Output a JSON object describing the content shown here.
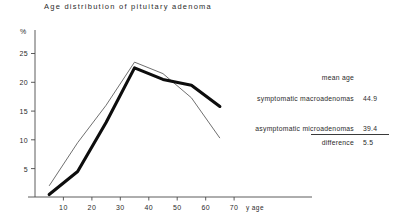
{
  "chart_data": {
    "type": "line",
    "title": "Age distribution of pituitary adenoma",
    "xlabel": "y age",
    "ylabel": "%",
    "x": [
      5,
      15,
      25,
      35,
      45,
      55,
      65
    ],
    "xlim": [
      0,
      75
    ],
    "ylim": [
      0,
      27
    ],
    "xticks": [
      10,
      20,
      30,
      40,
      50,
      60,
      70
    ],
    "yticks": [
      5,
      10,
      15,
      20,
      25
    ],
    "grid": false,
    "legend_position": "right",
    "series": [
      {
        "name": "symptomatic macroadenomas",
        "style": "thick",
        "mean_age": "44.9",
        "values": [
          0.5,
          4.5,
          13.0,
          22.5,
          20.5,
          19.5,
          15.8
        ]
      },
      {
        "name": "asymptomatic microadenomas",
        "style": "thin",
        "mean_age": "39.4",
        "values": [
          2.0,
          9.5,
          16.0,
          23.5,
          21.5,
          17.3,
          10.3
        ]
      }
    ],
    "annotations": {
      "mean_age_header": "mean  age",
      "difference_label": "difference",
      "difference_value": "5.5"
    }
  },
  "axis": {
    "y_unit": "%",
    "y_tick_labels": [
      "25",
      "20",
      "15",
      "10",
      "5"
    ],
    "x_tick_labels": [
      "10",
      "20",
      "30",
      "40",
      "50",
      "60",
      "70"
    ],
    "x_unit": "y age"
  },
  "legend": {
    "header": "mean  age",
    "rows": [
      {
        "label": "symptomatic macroadenomas",
        "value": "44.9"
      },
      {
        "label": "asymptomatic microadenomas",
        "value": "39.4"
      },
      {
        "label": "difference",
        "value": "5.5"
      }
    ]
  }
}
